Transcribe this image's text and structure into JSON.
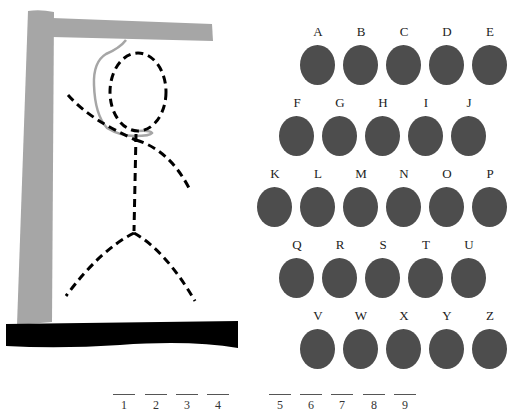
{
  "game": "Hangman",
  "colors": {
    "post": "#a6a6a6",
    "rope": "#a6a6a6",
    "base": "#000000",
    "figure": "#000000",
    "letter_disc": "#4d4d4d",
    "background": "#ffffff"
  },
  "figure": {
    "style": "dashed",
    "parts": [
      "head",
      "body",
      "left-arm",
      "right-arm",
      "left-leg",
      "right-leg"
    ]
  },
  "keyboard": {
    "rows": [
      {
        "keys": [
          {
            "letter": "A",
            "x": 300,
            "y": 25
          },
          {
            "letter": "B",
            "x": 343,
            "y": 25
          },
          {
            "letter": "C",
            "x": 386,
            "y": 25
          },
          {
            "letter": "D",
            "x": 429,
            "y": 25
          },
          {
            "letter": "E",
            "x": 472,
            "y": 25
          }
        ]
      },
      {
        "keys": [
          {
            "letter": "F",
            "x": 279,
            "y": 96
          },
          {
            "letter": "G",
            "x": 322,
            "y": 96
          },
          {
            "letter": "H",
            "x": 365,
            "y": 96
          },
          {
            "letter": "I",
            "x": 408,
            "y": 96
          },
          {
            "letter": "J",
            "x": 451,
            "y": 96
          }
        ]
      },
      {
        "keys": [
          {
            "letter": "K",
            "x": 257,
            "y": 167
          },
          {
            "letter": "L",
            "x": 300,
            "y": 167
          },
          {
            "letter": "M",
            "x": 343,
            "y": 167
          },
          {
            "letter": "N",
            "x": 386,
            "y": 167
          },
          {
            "letter": "O",
            "x": 429,
            "y": 167
          },
          {
            "letter": "P",
            "x": 472,
            "y": 167
          }
        ]
      },
      {
        "keys": [
          {
            "letter": "Q",
            "x": 279,
            "y": 238
          },
          {
            "letter": "R",
            "x": 322,
            "y": 238
          },
          {
            "letter": "S",
            "x": 365,
            "y": 238
          },
          {
            "letter": "T",
            "x": 408,
            "y": 238
          },
          {
            "letter": "U",
            "x": 451,
            "y": 238
          }
        ]
      },
      {
        "keys": [
          {
            "letter": "V",
            "x": 300,
            "y": 309
          },
          {
            "letter": "W",
            "x": 343,
            "y": 309
          },
          {
            "letter": "X",
            "x": 386,
            "y": 309
          },
          {
            "letter": "Y",
            "x": 429,
            "y": 309
          },
          {
            "letter": "Z",
            "x": 472,
            "y": 309
          }
        ]
      }
    ]
  },
  "word": {
    "slots": [
      {
        "num": "1",
        "x": 113
      },
      {
        "num": "2",
        "x": 145
      },
      {
        "num": "3",
        "x": 176
      },
      {
        "num": "4",
        "x": 207
      },
      {
        "num": "5",
        "x": 269
      },
      {
        "num": "6",
        "x": 300
      },
      {
        "num": "7",
        "x": 331
      },
      {
        "num": "8",
        "x": 363
      },
      {
        "num": "9",
        "x": 394
      }
    ]
  }
}
